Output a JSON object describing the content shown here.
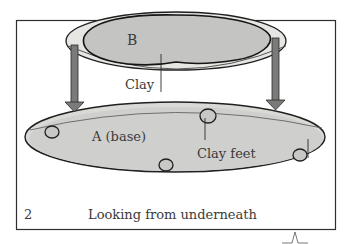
{
  "figure": {
    "number": "2",
    "caption": "Looking from underneath",
    "labels": {
      "top_piece": "B",
      "clay": "Clay",
      "base": "A (base)",
      "clay_feet": "Clay feet"
    },
    "colors": {
      "frame": "#2e2e2e",
      "plate_rim": "#e6e6e2",
      "clay_fill": "#c4c4c2",
      "base_fill": "#cfcfcd",
      "arrow_fill": "#7a7a78",
      "outline": "#1f1f1f",
      "text": "#3a3a3a"
    }
  }
}
